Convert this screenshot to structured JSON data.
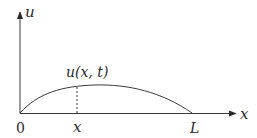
{
  "diagram": {
    "axes": {
      "y_label": "u",
      "x_label": "x"
    },
    "tick_labels": {
      "origin": "0",
      "point": "x",
      "end": "L"
    },
    "curve_label": "u(x, t)",
    "colors": {
      "stroke": "#3a3a3a",
      "text": "#2a2a2a",
      "background": "#ffffff"
    }
  }
}
